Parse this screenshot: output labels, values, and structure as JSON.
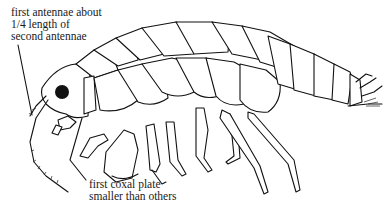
{
  "figure": {
    "labels": [
      {
        "id": "antennae",
        "lines": [
          "first antennae about",
          "1/4 length of",
          "second antennae"
        ]
      },
      {
        "id": "coxal",
        "lines": [
          "first coxal plate",
          "smaller than others"
        ]
      }
    ]
  },
  "colors": {
    "ink": "#111111",
    "background": "#ffffff"
  }
}
